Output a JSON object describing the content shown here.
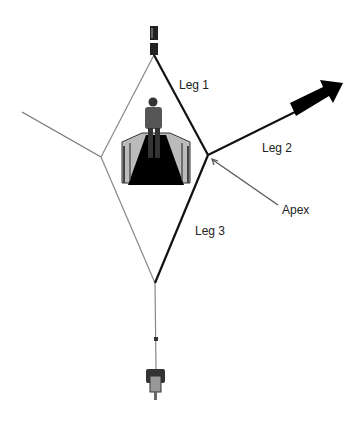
{
  "diagram": {
    "labels": {
      "leg1": "Leg 1",
      "leg2": "Leg 2",
      "leg3": "Leg 3",
      "apex": "Apex"
    },
    "elements": [
      "top-post",
      "person-on-walkway",
      "diamond-rope-frame",
      "direction-arrow",
      "apex-pointer",
      "bottom-weight",
      "left-tether"
    ],
    "colors": {
      "line": "#111111",
      "thin_line": "#777777",
      "arrow": "#000000"
    }
  }
}
